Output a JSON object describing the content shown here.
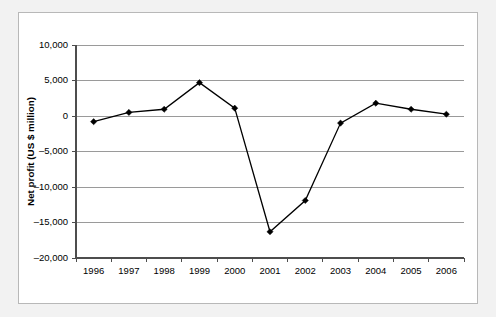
{
  "chart_data": {
    "type": "line",
    "title": "",
    "xlabel": "",
    "ylabel": "Net profit (US $ million)",
    "categories": [
      "1996",
      "1997",
      "1998",
      "1999",
      "2000",
      "2001",
      "2002",
      "2003",
      "2004",
      "2005",
      "2006"
    ],
    "values": [
      -800,
      500,
      950,
      4700,
      1100,
      -16300,
      -11900,
      -1000,
      1800,
      950,
      250
    ],
    "series": [
      {
        "name": "Net profit",
        "values": [
          -800,
          500,
          950,
          4700,
          1100,
          -16300,
          -11900,
          -1000,
          1800,
          950,
          250
        ]
      }
    ],
    "ylim": [
      -20000,
      10000
    ],
    "ytick_values": [
      10000,
      5000,
      0,
      -5000,
      -10000,
      -15000,
      -20000
    ],
    "ytick_labels": [
      "10,000",
      "5,000",
      "0",
      "-5,000",
      "-10,000",
      "-15,000",
      "-20,000"
    ],
    "grid": "horizontal",
    "legend": "none",
    "marker": "diamond",
    "line_color": "#000000",
    "grid_color": "#9a9a9a",
    "axis_color": "#4d4d4d",
    "panel_background": "#ffffff",
    "outer_background": "#f2f2f2"
  },
  "axes": {
    "y_title": "Net profit (US $ million)",
    "y_labels": [
      "10,000",
      "5,000",
      "0",
      "-5,000",
      "-10,000",
      "-15,000",
      "-20,000"
    ],
    "x_labels": [
      "1996",
      "1997",
      "1998",
      "1999",
      "2000",
      "2001",
      "2002",
      "2003",
      "2004",
      "2005",
      "2006"
    ]
  }
}
